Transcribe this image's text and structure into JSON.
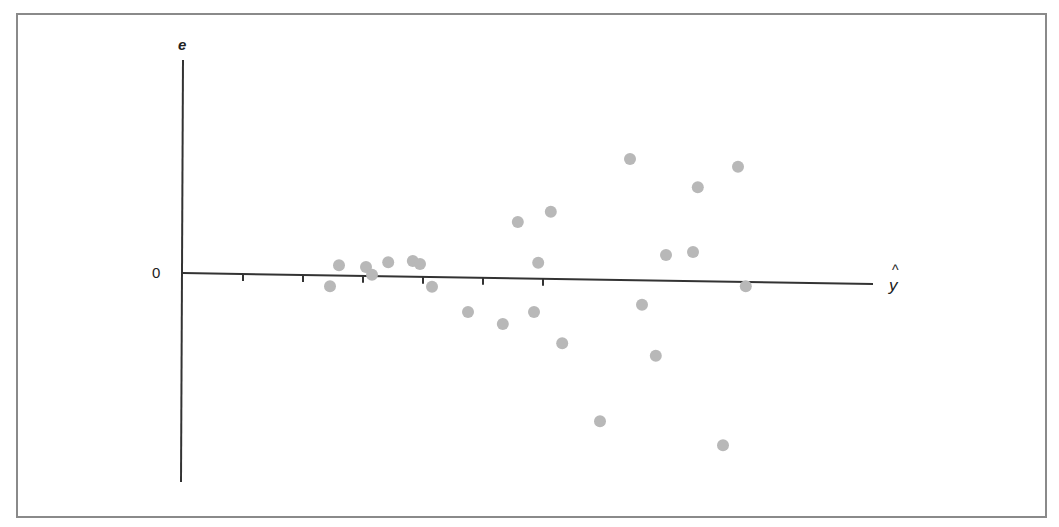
{
  "chart_data": {
    "type": "scatter",
    "title": "",
    "xlabel": "ŷ",
    "ylabel": "e",
    "y_tick_labels": [
      "0"
    ],
    "x_tick_labels": [],
    "xlim": [
      0,
      11.5
    ],
    "ylim": [
      -3.5,
      3.6
    ],
    "grid": false,
    "legend": null,
    "point_color": "#b8b8b8",
    "axis_color": "#333333",
    "x_ticks": [
      1,
      2,
      3,
      4,
      5,
      6
    ],
    "points": [
      {
        "x": 2.45,
        "y": -0.22
      },
      {
        "x": 2.6,
        "y": 0.13
      },
      {
        "x": 3.05,
        "y": 0.1
      },
      {
        "x": 3.15,
        "y": -0.03
      },
      {
        "x": 3.42,
        "y": 0.18
      },
      {
        "x": 3.83,
        "y": 0.2
      },
      {
        "x": 3.95,
        "y": 0.15
      },
      {
        "x": 4.15,
        "y": -0.23
      },
      {
        "x": 4.75,
        "y": -0.65
      },
      {
        "x": 5.33,
        "y": -0.85
      },
      {
        "x": 5.58,
        "y": 0.85
      },
      {
        "x": 5.85,
        "y": -0.65
      },
      {
        "x": 5.92,
        "y": 0.17
      },
      {
        "x": 6.13,
        "y": 1.02
      },
      {
        "x": 6.32,
        "y": -1.17
      },
      {
        "x": 6.95,
        "y": -2.47
      },
      {
        "x": 7.45,
        "y": 1.9
      },
      {
        "x": 7.65,
        "y": -0.53
      },
      {
        "x": 7.88,
        "y": -1.38
      },
      {
        "x": 8.05,
        "y": 0.3
      },
      {
        "x": 8.5,
        "y": 0.35
      },
      {
        "x": 8.58,
        "y": 1.43
      },
      {
        "x": 9.0,
        "y": -2.87
      },
      {
        "x": 9.25,
        "y": 1.77
      },
      {
        "x": 9.38,
        "y": -0.22
      }
    ]
  },
  "labels": {
    "y_axis": "e",
    "x_axis": "y",
    "x_hat": "^",
    "zero": "0"
  }
}
